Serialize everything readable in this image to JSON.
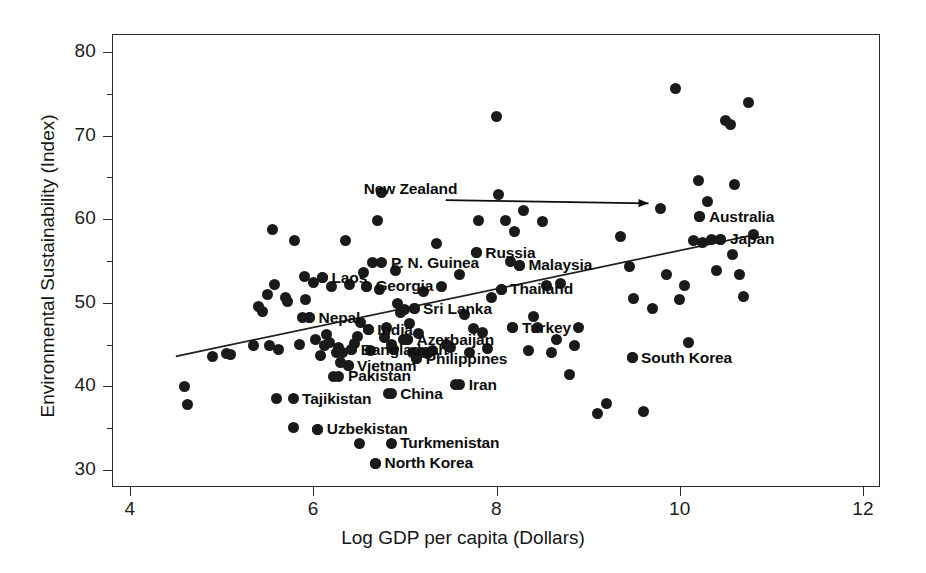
{
  "chart_data": {
    "type": "scatter",
    "title": "",
    "xlabel": "Log GDP per capita (Dollars)",
    "ylabel": "Environmental Sustainability (Index)",
    "xlim": [
      3.8,
      12.4
    ],
    "ylim": [
      28.0,
      82.0
    ],
    "xticks": [
      4,
      6,
      8,
      10,
      12
    ],
    "yticks": [
      30,
      40,
      50,
      60,
      70,
      80
    ],
    "grid": false,
    "legend": null,
    "trendline": {
      "type": "linear-fit",
      "x_start": 4.5,
      "y_start": 43.6,
      "x_end": 10.8,
      "y_end": 58.1
    },
    "annotations": [
      {
        "text": "New Zealand",
        "kind": "arrow-callout",
        "label_x": 6.55,
        "label_y": 63.6,
        "target_x": 9.79,
        "target_y": 61.3
      }
    ],
    "labeled_points": [
      {
        "label": "P. N. Guinea",
        "x": 6.75,
        "y": 54.8,
        "side": "right"
      },
      {
        "label": "Laos",
        "x": 6.1,
        "y": 53.0,
        "side": "right"
      },
      {
        "label": "Georgia",
        "x": 6.58,
        "y": 52.0,
        "side": "right"
      },
      {
        "label": "Nepal",
        "x": 5.96,
        "y": 48.2,
        "side": "right"
      },
      {
        "label": "Sri Lanka",
        "x": 7.1,
        "y": 49.3,
        "side": "right"
      },
      {
        "label": "India",
        "x": 6.6,
        "y": 46.8,
        "side": "right"
      },
      {
        "label": "Azerbaijan",
        "x": 7.03,
        "y": 45.6,
        "side": "right"
      },
      {
        "label": "Bangladesh",
        "x": 6.42,
        "y": 44.4,
        "side": "right"
      },
      {
        "label": "Vietnam",
        "x": 6.38,
        "y": 42.5,
        "side": "right"
      },
      {
        "label": "Philippines",
        "x": 7.13,
        "y": 43.3,
        "side": "right"
      },
      {
        "label": "Pakistan",
        "x": 6.28,
        "y": 41.2,
        "side": "right"
      },
      {
        "label": "Tajikistan",
        "x": 5.78,
        "y": 38.5,
        "side": "right"
      },
      {
        "label": "China",
        "x": 6.85,
        "y": 39.1,
        "side": "right"
      },
      {
        "label": "Iran",
        "x": 7.6,
        "y": 40.2,
        "side": "right"
      },
      {
        "label": "Uzbekistan",
        "x": 6.05,
        "y": 34.9,
        "side": "right"
      },
      {
        "label": "Turkmenistan",
        "x": 6.85,
        "y": 33.2,
        "side": "right"
      },
      {
        "label": "North Korea",
        "x": 6.68,
        "y": 30.8,
        "side": "right"
      },
      {
        "label": "Russia",
        "x": 7.78,
        "y": 56.0,
        "side": "right"
      },
      {
        "label": "Malaysia",
        "x": 8.25,
        "y": 54.5,
        "side": "right"
      },
      {
        "label": "Thailand",
        "x": 8.05,
        "y": 51.6,
        "side": "right"
      },
      {
        "label": "Turkey",
        "x": 8.18,
        "y": 47.0,
        "side": "right"
      },
      {
        "label": "South Korea",
        "x": 9.48,
        "y": 43.4,
        "side": "right"
      },
      {
        "label": "Australia",
        "x": 10.22,
        "y": 60.3,
        "side": "right"
      },
      {
        "label": "Japan",
        "x": 10.45,
        "y": 57.6,
        "side": "right"
      }
    ],
    "x": [
      4.6,
      4.63,
      4.9,
      5.05,
      5.1,
      5.35,
      5.4,
      5.45,
      5.5,
      5.52,
      5.55,
      5.58,
      5.6,
      5.62,
      5.7,
      5.72,
      5.78,
      5.8,
      5.85,
      5.88,
      5.9,
      5.92,
      5.96,
      6.0,
      6.02,
      6.05,
      6.08,
      6.1,
      6.12,
      6.15,
      6.18,
      6.2,
      6.22,
      6.25,
      6.28,
      6.3,
      6.32,
      6.35,
      6.38,
      6.4,
      6.42,
      6.45,
      6.48,
      6.5,
      6.52,
      6.55,
      6.58,
      6.6,
      6.62,
      6.65,
      6.68,
      6.7,
      6.72,
      6.75,
      6.78,
      6.8,
      6.82,
      6.85,
      6.88,
      6.9,
      6.92,
      6.95,
      6.98,
      7.0,
      7.03,
      7.05,
      7.08,
      7.1,
      7.13,
      7.15,
      7.18,
      7.2,
      7.25,
      7.3,
      7.35,
      7.4,
      7.45,
      7.5,
      7.55,
      7.6,
      7.65,
      7.7,
      7.75,
      7.78,
      7.8,
      7.85,
      7.9,
      7.95,
      8.0,
      8.02,
      8.05,
      8.1,
      8.15,
      8.18,
      8.2,
      8.25,
      8.3,
      8.35,
      8.4,
      8.45,
      8.5,
      8.55,
      8.6,
      8.65,
      8.7,
      8.8,
      8.85,
      8.9,
      9.1,
      9.2,
      9.35,
      9.45,
      9.48,
      9.5,
      9.6,
      9.7,
      9.79,
      9.85,
      9.95,
      10.0,
      10.05,
      10.1,
      10.15,
      10.2,
      10.22,
      10.25,
      10.3,
      10.35,
      10.4,
      10.45,
      10.5,
      10.55,
      10.58,
      10.6,
      10.65,
      10.7,
      10.75,
      10.8
    ],
    "y": [
      40.0,
      37.8,
      43.6,
      43.9,
      43.8,
      44.9,
      49.5,
      49.0,
      51.0,
      44.9,
      58.8,
      52.2,
      38.5,
      44.4,
      50.6,
      50.2,
      35.1,
      57.5,
      45.0,
      48.2,
      53.2,
      50.4,
      48.2,
      52.4,
      45.6,
      34.9,
      43.7,
      53.0,
      44.9,
      46.2,
      45.3,
      52.0,
      41.2,
      44.0,
      44.6,
      42.9,
      44.1,
      57.4,
      42.5,
      52.2,
      44.4,
      45.1,
      46.0,
      33.2,
      47.6,
      53.6,
      52.0,
      46.8,
      44.3,
      54.8,
      30.8,
      59.9,
      51.6,
      63.2,
      45.8,
      47.1,
      39.1,
      45.0,
      44.4,
      53.9,
      49.9,
      48.8,
      45.6,
      49.2,
      45.6,
      47.5,
      44.0,
      49.3,
      43.3,
      46.3,
      44.1,
      51.4,
      43.9,
      44.3,
      57.1,
      51.9,
      45.0,
      44.6,
      40.2,
      53.4,
      48.6,
      44.0,
      46.9,
      56.0,
      59.9,
      46.4,
      44.5,
      50.6,
      72.3,
      62.9,
      51.6,
      59.8,
      55.0,
      47.0,
      58.5,
      54.5,
      61.1,
      44.3,
      48.4,
      47.0,
      59.7,
      52.1,
      44.1,
      45.6,
      52.3,
      41.4,
      44.9,
      47.0,
      36.8,
      38.0,
      57.9,
      54.4,
      43.4,
      50.5,
      37.0,
      49.3,
      61.3,
      53.4,
      75.6,
      50.4,
      52.1,
      45.2,
      57.4,
      64.6,
      60.3,
      57.2,
      62.1,
      57.6,
      53.9,
      57.6,
      71.8,
      71.3,
      55.8,
      64.1,
      53.4,
      50.7,
      74.0,
      58.2
    ]
  }
}
